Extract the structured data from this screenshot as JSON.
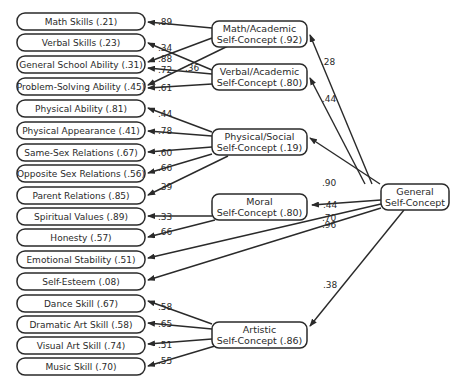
{
  "diagram": {
    "type": "path-diagram",
    "general": {
      "line1": "General",
      "line2": "Self-Concept"
    },
    "constructs": [
      {
        "id": "math",
        "line1": "Math/Academic",
        "line2": "Self-Concept (.92)",
        "path_from_general": ".28"
      },
      {
        "id": "verbal",
        "line1": "Verbal/Academic",
        "line2": "Self-Concept (.80)",
        "path_from_general": ".44"
      },
      {
        "id": "physical",
        "line1": "Physical/Social",
        "line2": "Self-Concept (.19)",
        "path_from_general": ".90"
      },
      {
        "id": "moral",
        "line1": "Moral",
        "line2": "Self-Concept (.80)",
        "path_from_general": ".44"
      },
      {
        "id": "artistic",
        "line1": "Artistic",
        "line2": "Self-Concept (.86)",
        "path_from_general": ".38"
      }
    ],
    "indicators": [
      {
        "label": "Math Skills (.21)",
        "coef": ".89",
        "from": "math"
      },
      {
        "label": "Verbal Skills (.23)",
        "coef": ".34",
        "from": "verbal"
      },
      {
        "label": "General School Ability (.31)",
        "coef": ".88",
        "from": "math",
        "coef2": ".72",
        "from2": "verbal"
      },
      {
        "label": "Problem-Solving Ability (.45)",
        "coef": ".36",
        "from": "math",
        "coef2": ".61",
        "from2": "verbal"
      },
      {
        "label": "Physical Ability (.81)",
        "coef": ".44",
        "from": "physical"
      },
      {
        "label": "Physical Appearance (.41)",
        "coef": ".78",
        "from": "physical"
      },
      {
        "label": "Same-Sex Relations (.67)",
        "coef": ".60",
        "from": "physical"
      },
      {
        "label": "Opposite Sex Relations (.56)",
        "coef": ".66",
        "from": "physical"
      },
      {
        "label": "Parent Relations (.85)",
        "coef": ".39",
        "from": "physical"
      },
      {
        "label": "Spiritual Values (.89)",
        "coef": ".33",
        "from": "moral"
      },
      {
        "label": "Honesty (.57)",
        "coef": ".66",
        "from": "moral"
      },
      {
        "label": "Emotional Stability (.51)",
        "coef": ".70",
        "from": "general"
      },
      {
        "label": "Self-Esteem (.08)",
        "coef": ".96",
        "from": "general"
      },
      {
        "label": "Dance Skill (.67)",
        "coef": ".58",
        "from": "artistic"
      },
      {
        "label": "Dramatic Art Skill (.58)",
        "coef": ".65",
        "from": "artistic"
      },
      {
        "label": "Visual Art Skill (.74)",
        "coef": ".51",
        "from": "artistic"
      },
      {
        "label": "Music Skill (.70)",
        "coef": ".55",
        "from": "artistic"
      }
    ]
  }
}
